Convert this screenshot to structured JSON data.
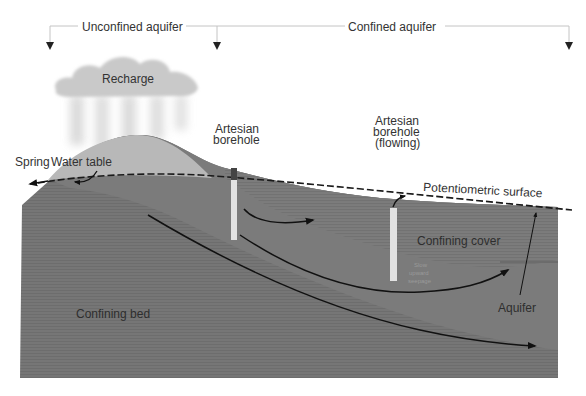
{
  "diagram": {
    "title_zones": {
      "unconfined": "Unconfined aquifer",
      "confined": "Confined aquifer"
    },
    "labels": {
      "recharge": "Recharge",
      "water_table": "Water table",
      "spring": "Spring",
      "artesian_borehole_line1": "Artesian",
      "artesian_borehole_line2": "borehole",
      "flowing_borehole_line1": "Artesian",
      "flowing_borehole_line2": "borehole",
      "flowing_borehole_line3": "(flowing)",
      "potentiometric_surface": "Potentiometric surface",
      "confining_cover": "Confining cover",
      "slow_seepage_line1": "Slow",
      "slow_seepage_line2": "upward",
      "slow_seepage_line3": "seepage",
      "aquifer": "Aquifer",
      "confining_bed": "Confining bed"
    },
    "colors": {
      "background": "#ffffff",
      "aquifer_fill": "#7a7a7a",
      "confining_fill": "#6f6f6f",
      "unconfined_zone_fill": "#b9b9b9",
      "cloud_fill": "#c8c8c8",
      "borehole_fill": "#e2e2e2",
      "flow_arrow": "#111111",
      "guide_line": "#c0c0c0"
    }
  }
}
